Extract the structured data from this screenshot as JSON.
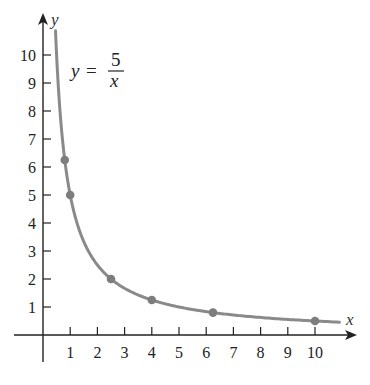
{
  "chart_data": {
    "type": "line",
    "title": "",
    "equation": {
      "lhs": "y",
      "eq": "=",
      "numerator": "5",
      "denominator": "x"
    },
    "xlabel": "x",
    "ylabel": "y",
    "xlim": [
      -1,
      11
    ],
    "ylim": [
      -1,
      11
    ],
    "xticks": [
      1,
      2,
      3,
      4,
      5,
      6,
      7,
      8,
      9,
      10
    ],
    "yticks": [
      1,
      2,
      3,
      4,
      5,
      6,
      7,
      8,
      9,
      10
    ],
    "grid": false,
    "curve": {
      "function": "5/x",
      "x_range": [
        0.46,
        10.9
      ]
    },
    "series": [
      {
        "name": "y = 5/x points",
        "x": [
          0.8,
          1,
          2.5,
          4,
          6.25,
          10
        ],
        "y": [
          6.25,
          5,
          2,
          1.25,
          0.8,
          0.5
        ]
      }
    ],
    "colors": {
      "curve": "#8a8a8a",
      "points": "#7d7d7d",
      "axis": "#222222"
    }
  }
}
